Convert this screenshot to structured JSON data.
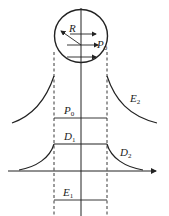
{
  "diagram": {
    "labels": {
      "radius": "R",
      "pressure_arrow": "P",
      "pressure_arrow_sub": "0",
      "pressure_line": "P",
      "pressure_line_sub": "0",
      "upper_curve": "E",
      "upper_curve_sub": "2",
      "plateau": "D",
      "plateau_sub": "1",
      "lower_curve": "D",
      "lower_curve_sub": "2",
      "bottom_line": "E",
      "bottom_line_sub": "1"
    },
    "colors": {
      "stroke": "#222222",
      "background": "#ffffff"
    }
  }
}
